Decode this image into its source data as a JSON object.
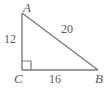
{
  "figure": {
    "kind": "right-triangle-diagram",
    "background_color": "#ffffff",
    "stroke_color": "#7a7a7a",
    "text_color": "#5a5a5a",
    "vertices": {
      "A": {
        "label": "A",
        "x": 22,
        "y": 13
      },
      "B": {
        "label": "B",
        "x": 98,
        "y": 70
      },
      "C": {
        "label": "C",
        "x": 22,
        "y": 70
      }
    },
    "sides": {
      "vertical_leg": {
        "label": "12",
        "from": "A",
        "to": "C"
      },
      "horizontal_leg": {
        "label": "16",
        "from": "C",
        "to": "B"
      },
      "hypotenuse": {
        "label": "20",
        "from": "A",
        "to": "B"
      }
    },
    "right_angle": {
      "at_vertex": "C",
      "marker": "square"
    }
  }
}
